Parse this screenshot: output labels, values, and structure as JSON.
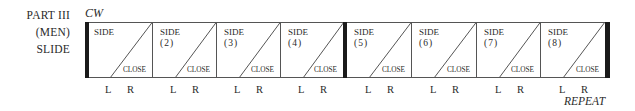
{
  "labels": {
    "part": "PART III",
    "group": "(MEN)",
    "step": "SLIDE",
    "direction": "CW",
    "repeat": "REPEAT"
  },
  "boxes": [
    {
      "side": "SIDE",
      "num": "",
      "close": "CLOSE",
      "left_foot": "L",
      "right_foot": "R"
    },
    {
      "side": "SIDE",
      "num": "(2)",
      "close": "CLOSE",
      "left_foot": "L",
      "right_foot": "R"
    },
    {
      "side": "SIDE",
      "num": "(3)",
      "close": "CLOSE",
      "left_foot": "L",
      "right_foot": "R"
    },
    {
      "side": "SIDE",
      "num": "(4)",
      "close": "CLOSE",
      "left_foot": "L",
      "right_foot": "R"
    },
    {
      "side": "SIDE",
      "num": "(5)",
      "close": "CLOSE",
      "left_foot": "L",
      "right_foot": "R"
    },
    {
      "side": "SIDE",
      "num": "(6)",
      "close": "CLOSE",
      "left_foot": "L",
      "right_foot": "R"
    },
    {
      "side": "SIDE",
      "num": "(7)",
      "close": "CLOSE",
      "left_foot": "L",
      "right_foot": "R"
    },
    {
      "side": "SIDE",
      "num": "(8)",
      "close": "CLOSE",
      "left_foot": "L",
      "right_foot": "R"
    }
  ],
  "colors": {
    "ink": "#2a2a2a",
    "bar": "#1a1a1a"
  }
}
